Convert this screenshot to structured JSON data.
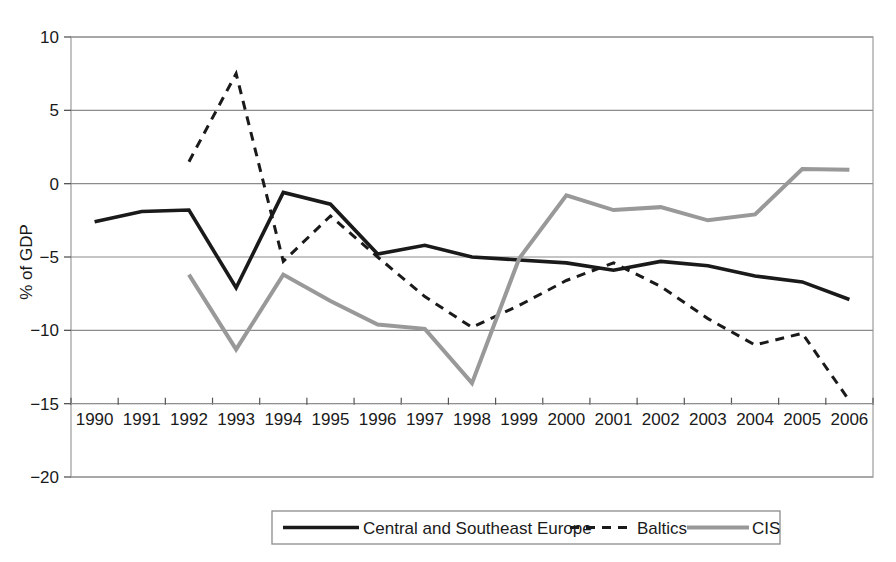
{
  "chart_data": {
    "type": "line",
    "title": "",
    "subtitle": "",
    "xlabel": "",
    "ylabel": "% of GDP",
    "x": [
      1990,
      1991,
      1992,
      1993,
      1994,
      1995,
      1996,
      1997,
      1998,
      1999,
      2000,
      2001,
      2002,
      2003,
      2004,
      2005,
      2006
    ],
    "xtick_labels": [
      "1990",
      "1991",
      "1992",
      "1993",
      "1994",
      "1995",
      "1996",
      "1997",
      "1998",
      "1999",
      "2000",
      "2001",
      "2002",
      "2003",
      "2004",
      "2005",
      "2006"
    ],
    "ytick_labels": [
      "10",
      "5",
      "0",
      "−5",
      "−10",
      "−15",
      "−20"
    ],
    "ytick_values": [
      10,
      5,
      0,
      -5,
      -10,
      -15,
      -20
    ],
    "ylim": [
      -20,
      10
    ],
    "grid": true,
    "grid_axis": "y",
    "legend_position": "bottom",
    "series": [
      {
        "name": "Central and Southeast Europe",
        "style": "solid",
        "color": "#1a1a1a",
        "width": 3.6,
        "x": [
          1990,
          1991,
          1992,
          1993,
          1994,
          1995,
          1996,
          1997,
          1998,
          1999,
          2000,
          2001,
          2002,
          2003,
          2004,
          2005,
          2006
        ],
        "values": [
          -2.6,
          -1.9,
          -1.8,
          -7.1,
          -0.6,
          -1.4,
          -4.8,
          -4.2,
          -5.0,
          -5.2,
          -5.4,
          -5.9,
          -5.3,
          -5.6,
          -6.3,
          -6.7,
          -7.9
        ]
      },
      {
        "name": "Baltics",
        "style": "dashed",
        "color": "#1a1a1a",
        "width": 3.0,
        "x": [
          1992,
          1993,
          1994,
          1995,
          1996,
          1997,
          1998,
          1999,
          2000,
          2001,
          2002,
          2003,
          2004,
          2005,
          2006
        ],
        "values": [
          1.5,
          7.5,
          -5.3,
          -2.2,
          -5.0,
          -7.7,
          -9.8,
          -8.3,
          -6.6,
          -5.4,
          -7.0,
          -9.2,
          -11.0,
          -10.2,
          -14.8
        ]
      },
      {
        "name": "CIS",
        "style": "solid",
        "color": "#999999",
        "width": 4.0,
        "x": [
          1992,
          1993,
          1994,
          1995,
          1996,
          1997,
          1998,
          1999,
          2000,
          2001,
          2002,
          2003,
          2004,
          2005,
          2006
        ],
        "values": [
          -6.2,
          -11.3,
          -6.2,
          -8.0,
          -9.6,
          -9.9,
          -13.6,
          -5.1,
          -0.8,
          -1.8,
          -1.6,
          -2.5,
          -2.1,
          1.0,
          0.95
        ]
      }
    ]
  },
  "axes": {
    "ylabel": "% of GDP",
    "ytick_0": "10",
    "ytick_1": "5",
    "ytick_2": "0",
    "ytick_3": "−5",
    "ytick_4": "−10",
    "ytick_5": "−15",
    "ytick_6": "−20"
  },
  "legend": {
    "items": [
      {
        "label": "Central and Southeast Europe",
        "style": "solid",
        "color": "#1a1a1a"
      },
      {
        "label": "Baltics",
        "style": "dashed",
        "color": "#1a1a1a"
      },
      {
        "label": "CIS",
        "style": "solid",
        "color": "#999999"
      }
    ]
  },
  "colors": {
    "cse": "#1a1a1a",
    "baltics": "#1a1a1a",
    "cis": "#999999",
    "grid": "#8c8c8c",
    "frame": "#b0b0b0",
    "background": "#ffffff"
  }
}
